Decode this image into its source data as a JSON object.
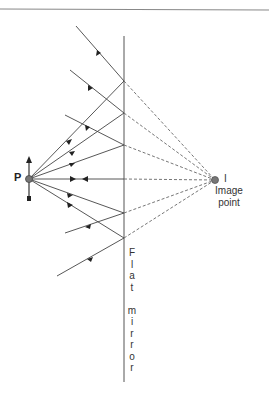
{
  "diagram": {
    "labels": {
      "object": "P",
      "image": "I",
      "image_caption_line1": "Image",
      "image_caption_line2": "point",
      "mirror_letters": [
        "F",
        "l",
        "a",
        "t",
        " ",
        "m",
        "i",
        "r",
        "r",
        "o",
        "r"
      ]
    },
    "colors": {
      "line": "#444444",
      "dashed": "#666666",
      "point_fill": "#777777",
      "rule": "#888888"
    },
    "geometry": {
      "object_point": [
        29,
        179
      ],
      "image_point": [
        215,
        180
      ],
      "mirror_x": 124,
      "mirror_y_range": [
        36,
        382
      ],
      "hit_points_y": [
        81,
        113,
        145,
        179,
        213,
        238
      ],
      "reflected_ends": [
        [
          76,
          26
        ],
        [
          70,
          70
        ],
        [
          65,
          115
        ],
        [
          29,
          179
        ],
        [
          65,
          233
        ],
        [
          57,
          276
        ]
      ]
    }
  }
}
